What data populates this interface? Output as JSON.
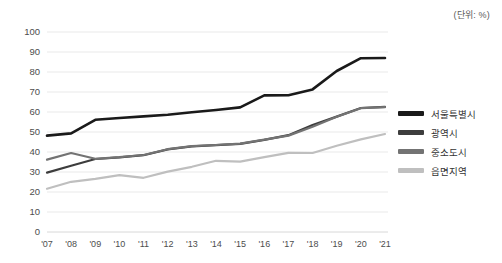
{
  "unit_note": "(단위: %)",
  "legend": {
    "position": "right",
    "items": [
      {
        "label": "서울특별시",
        "color": "#1a1a1a",
        "thickness": 5
      },
      {
        "label": "광역시",
        "color": "#3d3d3d",
        "thickness": 4.5
      },
      {
        "label": "중소도시",
        "color": "#737373",
        "thickness": 4.5
      },
      {
        "label": "읍면지역",
        "color": "#bfbfbf",
        "thickness": 4.5
      }
    ]
  },
  "chart_data": {
    "type": "line",
    "title": "",
    "subtitle": "",
    "xlabel": "",
    "ylabel": "",
    "annotations": [
      "(단위: %)"
    ],
    "grid": true,
    "legend_position": "right",
    "xlim": [
      0,
      14
    ],
    "ylim": [
      0,
      100
    ],
    "ytick_values": [
      0,
      10,
      20,
      30,
      40,
      50,
      60,
      70,
      80,
      90,
      100
    ],
    "categories": [
      "'07",
      "'08",
      "'09",
      "'10",
      "'11",
      "'12",
      "'13",
      "'14",
      "'15",
      "'16",
      "'17",
      "'18",
      "'19",
      "'20",
      "'21"
    ],
    "series": [
      {
        "name": "서울특별시",
        "color": "#1a1a1a",
        "values": [
          48.2,
          49.3,
          56.1,
          57.0,
          57.8,
          58.6,
          59.9,
          61.0,
          62.3,
          68.3,
          68.4,
          71.3,
          80.5,
          86.9,
          87.0
        ]
      },
      {
        "name": "광역시",
        "color": "#3d3d3d",
        "values": [
          29.7,
          33.1,
          36.5,
          37.3,
          38.4,
          41.3,
          42.8,
          43.4,
          44.1,
          46.1,
          48.4,
          53.5,
          57.7,
          62.0,
          62.6
        ]
      },
      {
        "name": "중소도시",
        "color": "#737373",
        "values": [
          36.2,
          39.5,
          36.6,
          37.4,
          38.5,
          41.4,
          42.9,
          43.5,
          44.2,
          46.2,
          48.2,
          52.6,
          57.6,
          61.9,
          62.4
        ]
      },
      {
        "name": "읍면지역",
        "color": "#bfbfbf",
        "values": [
          21.6,
          25.1,
          26.6,
          28.4,
          27.1,
          30.2,
          32.6,
          35.6,
          35.2,
          37.4,
          39.6,
          39.5,
          43.1,
          46.3,
          49.0
        ]
      }
    ]
  }
}
